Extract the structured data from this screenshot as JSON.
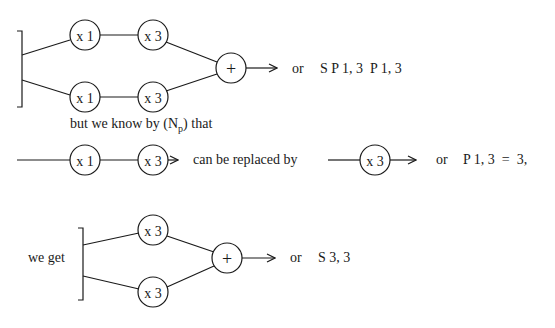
{
  "diagram1": {
    "nodes": {
      "top_a": "x 1",
      "top_b": "x 3",
      "bot_a": "x 1",
      "bot_b": "x 3",
      "sum": "+"
    },
    "result_prefix": "or",
    "result_expr": "S P 1, 3  P 1, 3"
  },
  "caption": {
    "text_before": "but we know by (N",
    "subscript": "p",
    "text_after": ") that"
  },
  "row2": {
    "nodes": {
      "a": "x 1",
      "b": "x 3",
      "replacement": "x 3"
    },
    "middle_text": "can be replaced by",
    "result_prefix": "or",
    "result_expr": "P 1, 3  =  3,"
  },
  "diagram3": {
    "lead_text": "we get",
    "nodes": {
      "top": "x 3",
      "bot": "x 3",
      "sum": "+"
    },
    "result_prefix": "or",
    "result_expr": "S 3, 3"
  },
  "colors": {
    "ink": "#1a1a1a",
    "background": "#ffffff"
  }
}
